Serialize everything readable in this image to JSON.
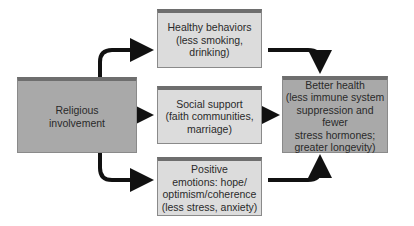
{
  "diagram": {
    "type": "flow",
    "colors": {
      "source_box": "#a9a9a9",
      "mediator_box": "#dcdcdc",
      "outcome_box": "#a9a9a9",
      "box_top_band": "#6e6e6e",
      "arrow": "#111111"
    },
    "nodes": {
      "religious": {
        "label": "Religious\ninvolvement"
      },
      "healthy": {
        "label": "Healthy behaviors\n(less smoking,\ndrinking)"
      },
      "social": {
        "label": "Social support\n(faith communities,\nmarriage)"
      },
      "positive": {
        "label": "Positive\nemotions: hope/\noptimism/coherence\n(less stress, anxiety)"
      },
      "outcome": {
        "label": "Better health\n(less immune system\nsuppression and fewer\nstress hormones;\ngreater longevity)"
      }
    },
    "edges": [
      {
        "from": "religious",
        "to": "healthy"
      },
      {
        "from": "religious",
        "to": "social"
      },
      {
        "from": "religious",
        "to": "positive"
      },
      {
        "from": "healthy",
        "to": "outcome"
      },
      {
        "from": "social",
        "to": "outcome"
      },
      {
        "from": "positive",
        "to": "outcome"
      }
    ]
  }
}
